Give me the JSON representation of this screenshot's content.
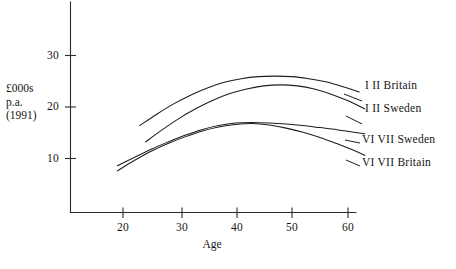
{
  "chart_data": {
    "type": "line",
    "title": "",
    "xlabel": "Age",
    "ylabel": "£000s p.a. (1991)",
    "ylabel_lines": [
      "£000s",
      "p.a.",
      "(1991)"
    ],
    "xlim": [
      15,
      66
    ],
    "ylim": [
      0,
      33
    ],
    "grid": false,
    "legend_position": "right-inline",
    "xticks": [
      20,
      30,
      40,
      50,
      60
    ],
    "xtick_labels": [
      "20",
      "30",
      "40",
      "50",
      "60"
    ],
    "yticks": [
      10,
      20,
      30
    ],
    "ytick_labels": [
      "10",
      "20",
      "30"
    ],
    "series": [
      {
        "name": "I II Britain",
        "label": "I II Britain",
        "class_part": "I II",
        "country_part": "Britain",
        "x": [
          23,
          26,
          29,
          32,
          35,
          38,
          41,
          44,
          47,
          50,
          53,
          56,
          59,
          62
        ],
        "values": [
          16.4,
          18.6,
          20.6,
          22.3,
          23.7,
          24.8,
          25.5,
          25.9,
          26.0,
          25.9,
          25.5,
          24.9,
          24.0,
          22.9
        ]
      },
      {
        "name": "I II Sweden",
        "label": "I II Sweden",
        "class_part": "I II",
        "country_part": "Sweden",
        "x": [
          24,
          27,
          30,
          33,
          36,
          39,
          42,
          45,
          48,
          51,
          54,
          57,
          60,
          63
        ],
        "values": [
          13.2,
          15.6,
          17.8,
          19.7,
          21.3,
          22.6,
          23.5,
          24.1,
          24.3,
          24.1,
          23.5,
          22.5,
          21.2,
          19.6
        ]
      },
      {
        "name": "VI VII Sweden",
        "label": "VI VII Sweden",
        "class_part": "VI VII",
        "country_part": "Sweden",
        "x": [
          19,
          22,
          25,
          28,
          31,
          34,
          37,
          40,
          43,
          46,
          49,
          52,
          55,
          58,
          61,
          63
        ],
        "values": [
          8.6,
          10.2,
          11.8,
          13.2,
          14.5,
          15.6,
          16.4,
          16.9,
          17.0,
          16.9,
          16.7,
          16.4,
          16.0,
          15.6,
          15.1,
          14.8
        ]
      },
      {
        "name": "VI VII Britain",
        "label": "VI VII Britain",
        "class_part": "VI VII",
        "country_part": "Britain",
        "x": [
          19,
          22,
          25,
          28,
          31,
          34,
          37,
          40,
          43,
          46,
          49,
          52,
          55,
          58,
          61,
          63
        ],
        "values": [
          7.6,
          9.6,
          11.4,
          12.9,
          14.2,
          15.3,
          16.1,
          16.6,
          16.8,
          16.5,
          15.9,
          15.1,
          14.1,
          12.9,
          11.6,
          10.6
        ]
      }
    ]
  },
  "axis": {
    "y_label_lines": [
      "£000s",
      "p.a.",
      "(1991)"
    ],
    "x_title": "Age",
    "ytick_labels": [
      "30",
      "20",
      "10"
    ],
    "xtick_labels": [
      "20",
      "30",
      "40",
      "50",
      "60"
    ]
  },
  "legend": {
    "items": [
      {
        "label": "I II  Britain"
      },
      {
        "label": "I II  Sweden"
      },
      {
        "label": "VI VII Sweden"
      },
      {
        "label": "VI VII Britain"
      }
    ]
  },
  "caption": {
    "text": ""
  },
  "colors": {
    "line": "#1d1d1d",
    "axis": "#2b2b2b",
    "text": "#161616",
    "background": "#ffffff"
  }
}
